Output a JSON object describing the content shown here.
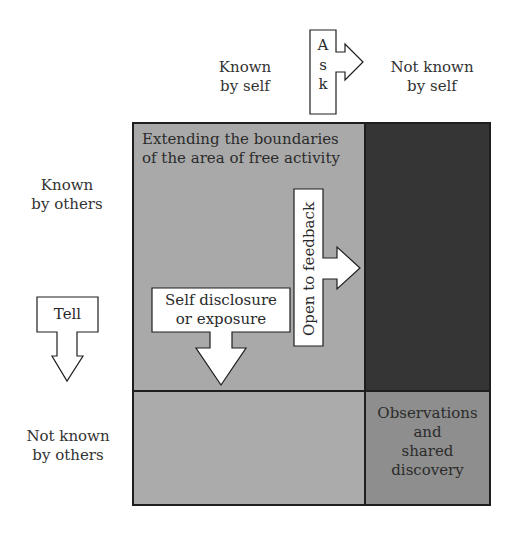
{
  "colors": {
    "open_area": "#a9a9a9",
    "blind_area": "#353535",
    "hidden_area": "#ababab",
    "unknown_area": "#8e8e8e",
    "border": "#1e1e1e",
    "arrow_fill": "#ffffff"
  },
  "column_headers": {
    "known_by_self": {
      "line1": "Known",
      "line2": "by self"
    },
    "not_known_by_self": {
      "line1": "Not known",
      "line2": "by self"
    }
  },
  "row_headers": {
    "known_by_others": {
      "line1": "Known",
      "line2": "by others"
    },
    "not_known_by_others": {
      "line1": "Not known",
      "line2": "by others"
    }
  },
  "quadrants": {
    "open": {
      "line1": "Extending the boundaries",
      "line2": "of the area of free activity"
    },
    "blind": {},
    "hidden": {},
    "unknown": {
      "lines": [
        "Observations",
        "and",
        "shared",
        "discovery"
      ]
    }
  },
  "arrows": {
    "ask": {
      "letters": [
        "A",
        "s",
        "k"
      ],
      "direction": "right"
    },
    "tell": {
      "label": "Tell",
      "direction": "down"
    },
    "self_disclosure": {
      "line1": "Self disclosure",
      "line2": "or exposure",
      "direction": "down"
    },
    "feedback": {
      "label": "Open to feedback",
      "direction": "right"
    }
  }
}
